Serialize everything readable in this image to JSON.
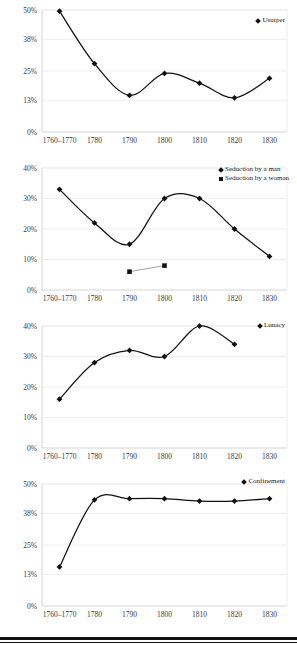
{
  "page": {
    "background": "#ffffff",
    "accent": "#111111",
    "gridline_color": "#ebebeb",
    "axis_color": "#c9c9c9"
  },
  "shared": {
    "categories": [
      "1760–1770",
      "1780",
      "1790",
      "1800",
      "1810",
      "1820",
      "1830"
    ],
    "x_label": "",
    "marker_diamond": "◆",
    "marker_square": "■"
  },
  "chart_data": [
    {
      "id": "usurper",
      "type": "line",
      "title": "",
      "xlabel": "",
      "ylabel": "",
      "legend": [
        "Usurper"
      ],
      "legend_position": "top-right",
      "grid": true,
      "categories": [
        "1760–1770",
        "1780",
        "1790",
        "1800",
        "1810",
        "1820",
        "1830"
      ],
      "ytick_labels": [
        "0%",
        "13%",
        "25%",
        "38%",
        "50%"
      ],
      "ytick_values": [
        0,
        13,
        25,
        38,
        50
      ],
      "ylim": [
        0,
        50
      ],
      "series": [
        {
          "name": "Usurper",
          "marker": "diamond",
          "values": [
            49.5,
            28,
            15,
            24,
            20,
            14,
            22
          ]
        }
      ]
    },
    {
      "id": "seduction",
      "type": "line",
      "title": "",
      "xlabel": "",
      "ylabel": "",
      "legend": [
        "Seduction by a man",
        "Seduction by a woman"
      ],
      "legend_position": "top-right",
      "grid": true,
      "categories": [
        "1760–1770",
        "1780",
        "1790",
        "1800",
        "1810",
        "1820",
        "1830"
      ],
      "ytick_labels": [
        "0%",
        "10%",
        "20%",
        "30%",
        "40%"
      ],
      "ytick_values": [
        0,
        10,
        20,
        30,
        40
      ],
      "ylim": [
        0,
        40
      ],
      "series": [
        {
          "name": "Seduction by a man",
          "marker": "diamond",
          "values": [
            33,
            22,
            15,
            30,
            30,
            20,
            11
          ]
        },
        {
          "name": "Seduction by a woman",
          "marker": "square",
          "values": [
            null,
            null,
            6,
            8,
            null,
            null,
            null
          ]
        }
      ]
    },
    {
      "id": "lunacy",
      "type": "line",
      "title": "",
      "xlabel": "",
      "ylabel": "",
      "legend": [
        "Lunacy"
      ],
      "legend_position": "top-right",
      "grid": true,
      "categories": [
        "1760–1770",
        "1780",
        "1790",
        "1800",
        "1810",
        "1820",
        "1830"
      ],
      "ytick_labels": [
        "0%",
        "10%",
        "20%",
        "30%",
        "40%"
      ],
      "ytick_values": [
        0,
        10,
        20,
        30,
        40
      ],
      "ylim": [
        0,
        40
      ],
      "series": [
        {
          "name": "Lunacy",
          "marker": "diamond",
          "values": [
            16,
            28,
            32,
            30,
            40,
            34,
            null
          ]
        }
      ]
    },
    {
      "id": "confinement",
      "type": "line",
      "title": "",
      "xlabel": "",
      "ylabel": "",
      "legend": [
        "Confinement"
      ],
      "legend_position": "top-right",
      "grid": true,
      "categories": [
        "1760–1770",
        "1780",
        "1790",
        "1800",
        "1810",
        "1820",
        "1830"
      ],
      "ytick_labels": [
        "0%",
        "13%",
        "25%",
        "38%",
        "50%"
      ],
      "ytick_values": [
        0,
        13,
        25,
        38,
        50
      ],
      "ylim": [
        0,
        50
      ],
      "series": [
        {
          "name": "Confinement",
          "marker": "diamond",
          "values": [
            16,
            43.5,
            44,
            44,
            43,
            43,
            44
          ]
        }
      ]
    }
  ]
}
